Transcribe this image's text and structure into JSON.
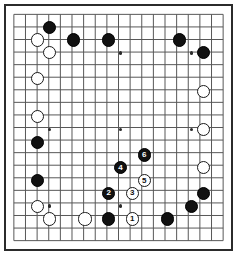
{
  "board": {
    "name": "go-board",
    "size": 19,
    "line_color": "#555555",
    "border_color": "#2b2b2b",
    "background_color": "#ffffff",
    "black_color": "#111111",
    "white_color": "#ffffff",
    "hoshi": [
      {
        "col": 4,
        "row": 4
      },
      {
        "col": 10,
        "row": 4
      },
      {
        "col": 16,
        "row": 4
      },
      {
        "col": 4,
        "row": 10
      },
      {
        "col": 10,
        "row": 10
      },
      {
        "col": 16,
        "row": 10
      },
      {
        "col": 4,
        "row": 16
      },
      {
        "col": 10,
        "row": 16
      },
      {
        "col": 16,
        "row": 16
      }
    ],
    "stones": [
      {
        "col": 4,
        "row": 2,
        "color": "black",
        "label": ""
      },
      {
        "col": 3,
        "row": 3,
        "color": "white",
        "label": ""
      },
      {
        "col": 6,
        "row": 3,
        "color": "black",
        "label": ""
      },
      {
        "col": 9,
        "row": 3,
        "color": "black",
        "label": ""
      },
      {
        "col": 15,
        "row": 3,
        "color": "black",
        "label": ""
      },
      {
        "col": 4,
        "row": 4,
        "color": "white",
        "label": ""
      },
      {
        "col": 17,
        "row": 4,
        "color": "black",
        "label": ""
      },
      {
        "col": 3,
        "row": 6,
        "color": "white",
        "label": ""
      },
      {
        "col": 17,
        "row": 7,
        "color": "white",
        "label": ""
      },
      {
        "col": 3,
        "row": 9,
        "color": "white",
        "label": ""
      },
      {
        "col": 17,
        "row": 10,
        "color": "white",
        "label": ""
      },
      {
        "col": 3,
        "row": 11,
        "color": "black",
        "label": ""
      },
      {
        "col": 12,
        "row": 12,
        "color": "black",
        "label": "6"
      },
      {
        "col": 10,
        "row": 13,
        "color": "black",
        "label": "4"
      },
      {
        "col": 17,
        "row": 13,
        "color": "white",
        "label": ""
      },
      {
        "col": 3,
        "row": 14,
        "color": "black",
        "label": ""
      },
      {
        "col": 12,
        "row": 14,
        "color": "white",
        "label": "5"
      },
      {
        "col": 9,
        "row": 15,
        "color": "black",
        "label": "2"
      },
      {
        "col": 11,
        "row": 15,
        "color": "white",
        "label": "3"
      },
      {
        "col": 17,
        "row": 15,
        "color": "black",
        "label": ""
      },
      {
        "col": 3,
        "row": 16,
        "color": "white",
        "label": ""
      },
      {
        "col": 16,
        "row": 16,
        "color": "black",
        "label": ""
      },
      {
        "col": 4,
        "row": 17,
        "color": "white",
        "label": ""
      },
      {
        "col": 7,
        "row": 17,
        "color": "white",
        "label": ""
      },
      {
        "col": 9,
        "row": 17,
        "color": "black",
        "label": ""
      },
      {
        "col": 11,
        "row": 17,
        "color": "white",
        "label": "1"
      },
      {
        "col": 14,
        "row": 17,
        "color": "black",
        "label": ""
      }
    ],
    "move_numbers": [
      "1",
      "2",
      "3",
      "4",
      "5",
      "6"
    ]
  }
}
